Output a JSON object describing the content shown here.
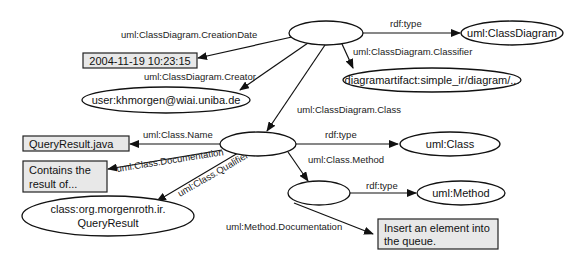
{
  "diagram": {
    "type": "rdf-graph",
    "nodes": {
      "class_diagram": {
        "label": ""
      },
      "uml_class_diagram": {
        "label": "uml:ClassDiagram"
      },
      "creation_date": {
        "label": "2004-11-19 10:23:15"
      },
      "classifier": {
        "label": "diagramartifact:simple_ir/diagram/..."
      },
      "creator": {
        "label": "user:khmorgen@wiai.uniba.de"
      },
      "class": {
        "label": ""
      },
      "query_result_java": {
        "label": "QueryResult.java"
      },
      "uml_class": {
        "label": "uml:Class"
      },
      "documentation": {
        "line1": "Contains the",
        "line2": "result of..."
      },
      "qualifier": {
        "line1": "class:org.morgenroth.ir.",
        "line2": "QueryResult"
      },
      "method": {
        "label": ""
      },
      "uml_method": {
        "label": "uml:Method"
      },
      "method_doc": {
        "line1": "Insert an element into",
        "line2": "the queue."
      }
    },
    "edges": {
      "cd_type": "rdf:type",
      "cd_creation_date": "uml:ClassDiagram.CreationDate",
      "cd_classifier": "uml:ClassDiagram.Classifier",
      "cd_creator": "uml:ClassDiagram.Creator",
      "cd_class": "uml:ClassDiagram.Class",
      "class_name": "uml:Class.Name",
      "class_type": "rdf:type",
      "class_documentation": "uml:Class.Documentation",
      "class_qualifier": "uml:Class.Qualifier",
      "class_method": "uml:Class.Method",
      "method_type": "rdf:type",
      "method_documentation": "uml:Method.Documentation"
    }
  }
}
